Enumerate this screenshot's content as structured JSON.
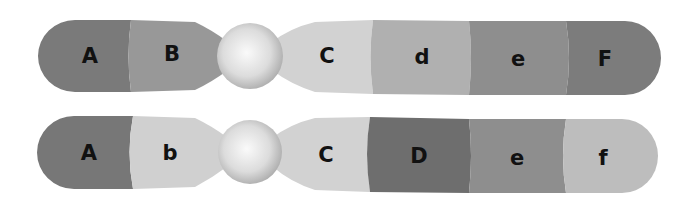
{
  "diagram": {
    "type": "chromosome-comparison",
    "chromosomes": [
      {
        "id": "chromosome-1",
        "segments": [
          {
            "label": "A",
            "color": "#7a7a7a"
          },
          {
            "label": "B",
            "color": "#989898"
          },
          {
            "label": "C",
            "color": "#d2d2d2"
          },
          {
            "label": "d",
            "color": "#b0b0b0"
          },
          {
            "label": "e",
            "color": "#8e8e8e"
          },
          {
            "label": "F",
            "color": "#7c7c7c"
          }
        ],
        "centromere_color": "#e6e6e6"
      },
      {
        "id": "chromosome-2",
        "segments": [
          {
            "label": "A",
            "color": "#777777"
          },
          {
            "label": "b",
            "color": "#d0d0d0"
          },
          {
            "label": "C",
            "color": "#d2d2d2"
          },
          {
            "label": "D",
            "color": "#6e6e6e"
          },
          {
            "label": "e",
            "color": "#8e8e8e"
          },
          {
            "label": "f",
            "color": "#bdbdbd"
          }
        ],
        "centromere_color": "#e6e6e6"
      }
    ]
  }
}
